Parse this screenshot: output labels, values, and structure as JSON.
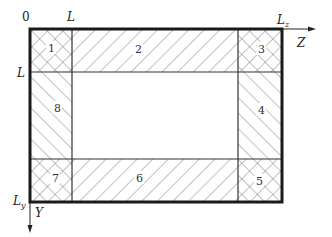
{
  "diagram": {
    "type": "domain-decomposition",
    "axes": {
      "origin_label": "0",
      "z_axis_label": "Z",
      "y_axis_label": "Y",
      "top_tick_L": "L",
      "top_tick_Lz": "L",
      "top_tick_Lz_sub": "z",
      "left_tick_L": "L",
      "left_tick_Ly": "L",
      "left_tick_Ly_sub": "y"
    },
    "regions": [
      {
        "id": "1",
        "label": "1",
        "hatch": "cross",
        "position": "top-left corner"
      },
      {
        "id": "2",
        "label": "2",
        "hatch": "backslash",
        "position": "top edge"
      },
      {
        "id": "3",
        "label": "3",
        "hatch": "cross",
        "position": "top-right corner"
      },
      {
        "id": "4",
        "label": "4",
        "hatch": "slash",
        "position": "right edge"
      },
      {
        "id": "5",
        "label": "5",
        "hatch": "cross",
        "position": "bottom-right corner"
      },
      {
        "id": "6",
        "label": "6",
        "hatch": "backslash",
        "position": "bottom edge"
      },
      {
        "id": "7",
        "label": "7",
        "hatch": "cross",
        "position": "bottom-left corner"
      },
      {
        "id": "8",
        "label": "8",
        "hatch": "slash",
        "position": "left edge"
      }
    ],
    "interior": {
      "label": "",
      "hatch": "none"
    },
    "colors": {
      "line": "#1a1a1a",
      "hatch": "#555555",
      "background": "#ffffff"
    }
  }
}
